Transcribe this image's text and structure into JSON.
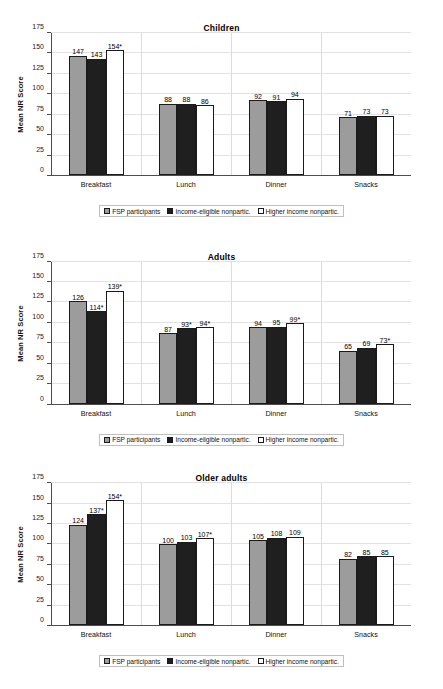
{
  "page": {
    "background": "#ffffff",
    "top_partial_text": ""
  },
  "series_colors": {
    "fsp_participants": "#9c9c9c",
    "income_eligible_nonpartic": "#1f1f1f",
    "higher_income_nonpartic": "#ffffff",
    "outline": "#1a1a1a",
    "axis": "#4d4d4d",
    "gridline": "#e2e2e2"
  },
  "legend": {
    "items": [
      {
        "label": "FSP participants",
        "swatch": "s1"
      },
      {
        "label": "Income-eligible nonpartic.",
        "swatch": "s2"
      },
      {
        "label": "Higher income nonpartic.",
        "swatch": "s3"
      }
    ]
  },
  "axis": {
    "ylabel": "Mean NR Score",
    "yticks": [
      "0",
      "25",
      "50",
      "75",
      "100",
      "125",
      "150",
      "175"
    ],
    "categories": [
      "Breakfast",
      "Lunch",
      "Dinner",
      "Snacks"
    ]
  },
  "chart_data": [
    {
      "type": "bar",
      "title": "Children",
      "xlabel": "",
      "ylabel": "Mean NR Score",
      "ylim": [
        0,
        175
      ],
      "yticks": [
        0,
        25,
        50,
        75,
        100,
        125,
        150,
        175
      ],
      "grid": true,
      "legend_position": "bottom",
      "categories": [
        "Breakfast",
        "Lunch",
        "Dinner",
        "Snacks"
      ],
      "series": [
        {
          "name": "FSP participants",
          "values": [
            147,
            88,
            92,
            71
          ],
          "labels": [
            "147",
            "88",
            "92",
            "71"
          ]
        },
        {
          "name": "Income-eligible nonpartic.",
          "values": [
            143,
            88,
            91,
            73
          ],
          "labels": [
            "143",
            "88",
            "91",
            "73"
          ]
        },
        {
          "name": "Higher income nonpartic.",
          "values": [
            154,
            86,
            94,
            73
          ],
          "labels": [
            "154*",
            "86",
            "94",
            "73"
          ]
        }
      ]
    },
    {
      "type": "bar",
      "title": "Adults",
      "xlabel": "",
      "ylabel": "Mean NR Score",
      "ylim": [
        0,
        175
      ],
      "yticks": [
        0,
        25,
        50,
        75,
        100,
        125,
        150,
        175
      ],
      "grid": true,
      "legend_position": "bottom",
      "categories": [
        "Breakfast",
        "Lunch",
        "Dinner",
        "Snacks"
      ],
      "series": [
        {
          "name": "FSP participants",
          "values": [
            126,
            87,
            94,
            65
          ],
          "labels": [
            "126",
            "87",
            "94",
            "65"
          ]
        },
        {
          "name": "Income-eligible nonpartic.",
          "values": [
            114,
            93,
            95,
            69
          ],
          "labels": [
            "114*",
            "93*",
            "95",
            "69"
          ]
        },
        {
          "name": "Higher income nonpartic.",
          "values": [
            139,
            94,
            99,
            73
          ],
          "labels": [
            "139*",
            "94*",
            "99*",
            "73*"
          ]
        }
      ]
    },
    {
      "type": "bar",
      "title": "Older adults",
      "xlabel": "",
      "ylabel": "Mean NR Score",
      "ylim": [
        0,
        175
      ],
      "yticks": [
        0,
        25,
        50,
        75,
        100,
        125,
        150,
        175
      ],
      "grid": true,
      "legend_position": "bottom",
      "categories": [
        "Breakfast",
        "Lunch",
        "Dinner",
        "Snacks"
      ],
      "series": [
        {
          "name": "FSP participants",
          "values": [
            124,
            100,
            105,
            82
          ],
          "labels": [
            "124",
            "100",
            "105",
            "82"
          ]
        },
        {
          "name": "Income-eligible nonpartic.",
          "values": [
            137,
            103,
            108,
            85
          ],
          "labels": [
            "137*",
            "103",
            "108",
            "85"
          ]
        },
        {
          "name": "Higher income nonpartic.",
          "values": [
            154,
            107,
            109,
            85
          ],
          "labels": [
            "154*",
            "107*",
            "109",
            "85"
          ]
        }
      ]
    }
  ]
}
